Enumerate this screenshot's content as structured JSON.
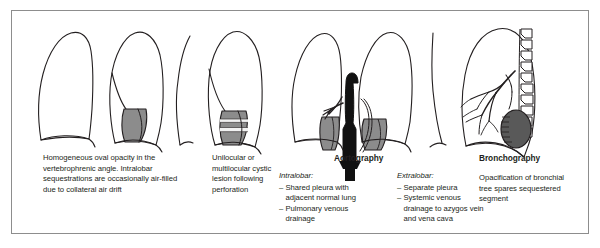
{
  "figure": {
    "border_color": "#8d8d8d",
    "background": "#ffffff"
  },
  "palette": {
    "ink": "#231f20",
    "sequestration_gray": "#8c8c8c",
    "sequestration_dark": "#595959",
    "aorta_black": "#111111",
    "air_fluid_white": "#f2f2f2"
  },
  "panels": [
    {
      "id": "panel-plain-film",
      "label": "plain-chest-radiograph",
      "heading": "",
      "caption": "Homogeneous oval opacity in the vertebrophrenic angle. Intralobar sequestrations are occasionally air-filled due to collateral air drift",
      "view": "frontal chest, both lungs, gray oval opacity at left vertebrophrenic angle"
    },
    {
      "id": "panel-cystic",
      "label": "cystic-lesion-radiograph",
      "heading": "",
      "caption": "Unilocular or multilocular cystic lesion following perforation",
      "view": "frontal chest, gray lesion with horizontal air-fluid levels at left base"
    },
    {
      "id": "panel-aortography",
      "label": "aortography",
      "heading": "Aortography",
      "subsections": [
        {
          "sub_heading": "Intralobar:",
          "items": [
            "Shared pleura with adjacent normal lung",
            "Pulmonary venous drainage"
          ]
        },
        {
          "sub_heading": "Extralobar:",
          "items": [
            "Separate pleura",
            "Systemic venous drainage to azygos vein and vena cava"
          ]
        }
      ],
      "view": "frontal chest with opacified black aorta sending systemic branches to bilateral gray sequestrations"
    },
    {
      "id": "panel-bronchography",
      "label": "bronchography",
      "heading": "Bronchography",
      "caption": "Opacification of bronchial tree spares sequestered segment",
      "view": "lateral chest with vertebral bodies, opacified bronchial tree, dark unopacified sequestered segment posteriorly"
    }
  ],
  "icons": {
    "lung_outline": "lung-outline-icon",
    "vertebra": "vertebra-icon",
    "bronchial_tree": "bronchial-tree-icon",
    "aorta": "aorta-icon",
    "sequestration_mass": "sequestration-mass-icon",
    "air_fluid_level": "air-fluid-level-icon"
  }
}
